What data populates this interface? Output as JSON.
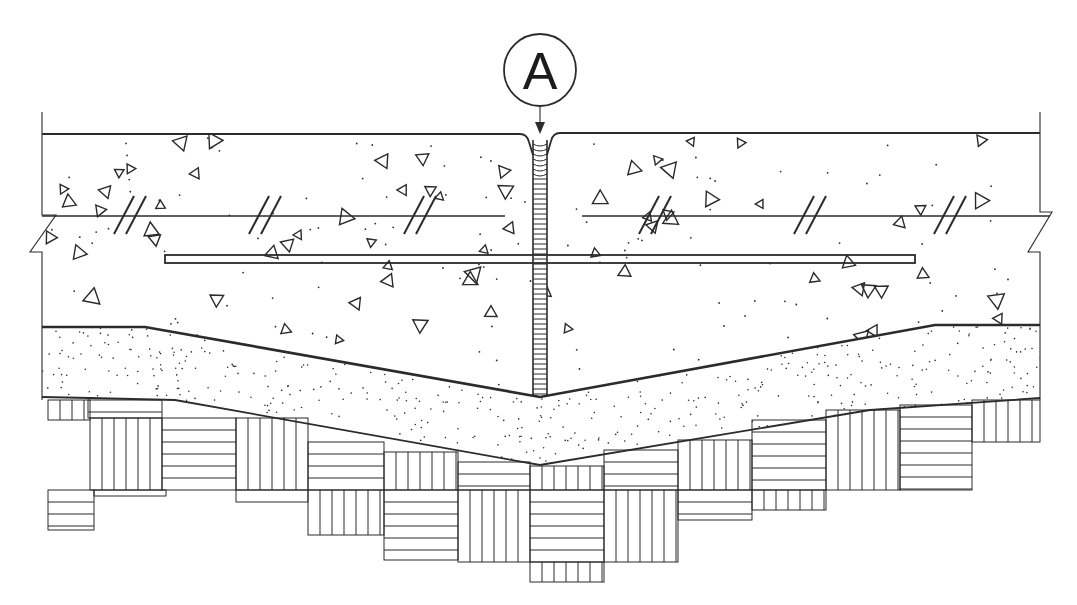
{
  "drawing": {
    "type": "construction joint section detail",
    "colors": {
      "line": "#2b2b2b",
      "background": "#ffffff"
    }
  },
  "callout": {
    "label": "A",
    "cx": 540,
    "cy": 70,
    "r": 36,
    "leader_end_y": 133
  },
  "slab": {
    "left_x": 42,
    "right_x": 1040,
    "top_y_left": 134,
    "top_y_right": 133,
    "bottom_profile": [
      [
        42,
        327
      ],
      [
        145,
        327
      ],
      [
        540,
        397
      ],
      [
        935,
        325
      ],
      [
        1040,
        325
      ]
    ],
    "joint": {
      "x_left": 533,
      "x_right": 547,
      "top_y": 140,
      "bottom_y": 397,
      "rung_spacing": 5
    }
  },
  "reinforcement": {
    "upper_bar": {
      "y": 216,
      "segments": [
        [
          42,
          505
        ],
        [
          582,
          1050
        ]
      ]
    },
    "dowel_bar": {
      "x1": 165,
      "x2": 915,
      "y1": 255,
      "y2": 263
    },
    "bar_break_marks_x": [
      140,
      275,
      430,
      665,
      820,
      960
    ]
  },
  "subbase": {
    "bottom_profile": [
      [
        42,
        397
      ],
      [
        90,
        398
      ],
      [
        175,
        400
      ],
      [
        540,
        465
      ],
      [
        870,
        410
      ],
      [
        1040,
        398
      ]
    ]
  },
  "subgrade_blocks": [
    {
      "x": 48,
      "y": 400,
      "w": 42,
      "h": 20,
      "h_pattern": false
    },
    {
      "x": 88,
      "y": 400,
      "w": 74,
      "h": 18,
      "h_pattern": true
    },
    {
      "x": 90,
      "y": 418,
      "w": 72,
      "h": 72,
      "h_pattern": false
    },
    {
      "x": 162,
      "y": 418,
      "w": 74,
      "h": 72,
      "h_pattern": true
    },
    {
      "x": 236,
      "y": 418,
      "w": 72,
      "h": 72,
      "h_pattern": false
    },
    {
      "x": 308,
      "y": 442,
      "w": 76,
      "h": 48,
      "h_pattern": true
    },
    {
      "x": 384,
      "y": 452,
      "w": 74,
      "h": 38,
      "h_pattern": false
    },
    {
      "x": 458,
      "y": 462,
      "w": 72,
      "h": 28,
      "h_pattern": true
    },
    {
      "x": 530,
      "y": 466,
      "w": 74,
      "h": 24,
      "h_pattern": false
    },
    {
      "x": 604,
      "y": 450,
      "w": 74,
      "h": 40,
      "h_pattern": true
    },
    {
      "x": 678,
      "y": 440,
      "w": 74,
      "h": 50,
      "h_pattern": false
    },
    {
      "x": 752,
      "y": 420,
      "w": 74,
      "h": 70,
      "h_pattern": true
    },
    {
      "x": 826,
      "y": 410,
      "w": 74,
      "h": 80,
      "h_pattern": false
    },
    {
      "x": 900,
      "y": 405,
      "w": 72,
      "h": 85,
      "h_pattern": true
    },
    {
      "x": 972,
      "y": 400,
      "w": 68,
      "h": 42,
      "h_pattern": false
    },
    {
      "x": 48,
      "y": 490,
      "w": 46,
      "h": 40,
      "h_pattern": true
    },
    {
      "x": 94,
      "y": 490,
      "w": 72,
      "h": 6,
      "h_pattern": true
    },
    {
      "x": 236,
      "y": 490,
      "w": 72,
      "h": 12,
      "h_pattern": true
    },
    {
      "x": 308,
      "y": 490,
      "w": 76,
      "h": 45,
      "h_pattern": false
    },
    {
      "x": 384,
      "y": 490,
      "w": 74,
      "h": 70,
      "h_pattern": true
    },
    {
      "x": 458,
      "y": 490,
      "w": 72,
      "h": 72,
      "h_pattern": false
    },
    {
      "x": 530,
      "y": 490,
      "w": 74,
      "h": 72,
      "h_pattern": true
    },
    {
      "x": 604,
      "y": 490,
      "w": 74,
      "h": 72,
      "h_pattern": false
    },
    {
      "x": 678,
      "y": 490,
      "w": 74,
      "h": 30,
      "h_pattern": true
    },
    {
      "x": 752,
      "y": 490,
      "w": 74,
      "h": 20,
      "h_pattern": false
    },
    {
      "x": 530,
      "y": 562,
      "w": 74,
      "h": 20,
      "h_pattern": false
    }
  ]
}
